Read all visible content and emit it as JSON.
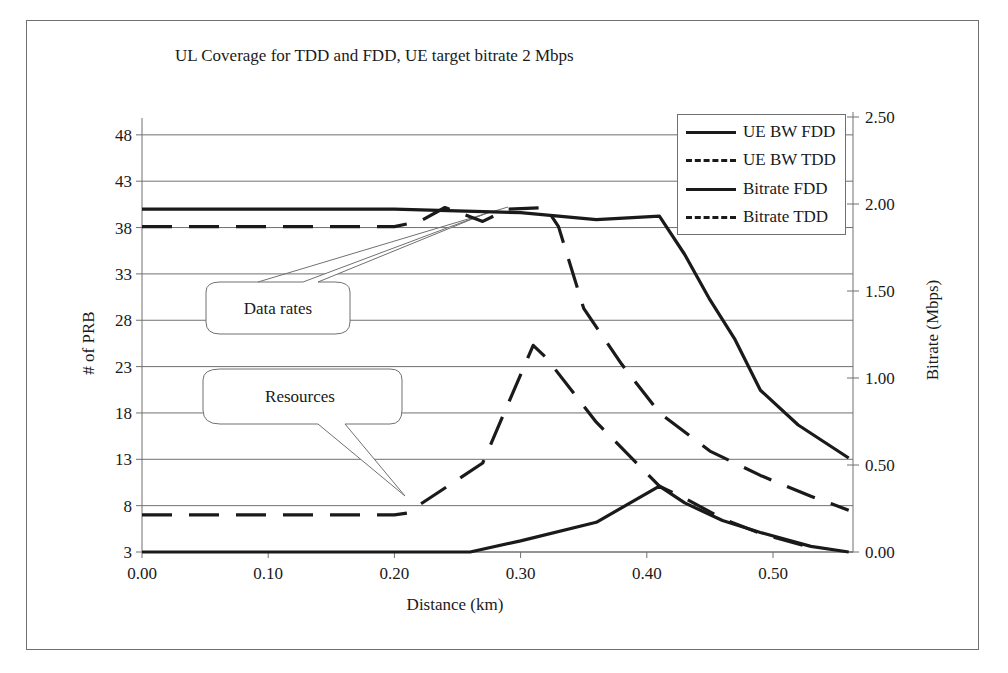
{
  "chart_data": {
    "type": "line",
    "title": "UL Coverage for TDD and FDD, UE target bitrate 2 Mbps",
    "xlabel": "Distance (km)",
    "ylabel": "# of PRB",
    "y2label": "Bitrate (Mbps)",
    "xlim": [
      0.0,
      0.57
    ],
    "ylim": [
      3,
      48
    ],
    "y2lim": [
      0.0,
      2.5
    ],
    "x_ticks": [
      "0.00",
      "0.10",
      "0.20",
      "0.30",
      "0.40",
      "0.50"
    ],
    "y_ticks": [
      "3",
      "8",
      "13",
      "18",
      "23",
      "28",
      "33",
      "38",
      "43",
      "48"
    ],
    "y2_ticks": [
      "0.00",
      "0.50",
      "1.00",
      "1.50",
      "2.00",
      "2.50"
    ],
    "grid": "horizontal",
    "legend_position": "upper right",
    "series": [
      {
        "name": "UE BW FDD",
        "axis": "left",
        "style": "solid",
        "x": [
          0.0,
          0.1,
          0.2,
          0.26,
          0.3,
          0.36,
          0.41,
          0.43,
          0.46,
          0.49,
          0.53,
          0.56
        ],
        "values": [
          3,
          3,
          3,
          3,
          4.2,
          6.2,
          10.1,
          8.3,
          6.4,
          5.1,
          3.6,
          3.0
        ]
      },
      {
        "name": "UE BW TDD",
        "axis": "left",
        "style": "dashed",
        "x": [
          0.0,
          0.1,
          0.2,
          0.21,
          0.27,
          0.31,
          0.32,
          0.36,
          0.41,
          0.43,
          0.46,
          0.49,
          0.53
        ],
        "values": [
          7,
          7,
          7,
          7.2,
          12.6,
          25.3,
          24.0,
          17.0,
          10.1,
          8.8,
          6.6,
          5.0,
          3.5
        ]
      },
      {
        "name": "Bitrate FDD",
        "axis": "right",
        "style": "solid",
        "x": [
          0.0,
          0.1,
          0.2,
          0.3,
          0.36,
          0.41,
          0.43,
          0.45,
          0.47,
          0.49,
          0.52,
          0.56
        ],
        "values": [
          1.97,
          1.97,
          1.97,
          1.95,
          1.91,
          1.93,
          1.71,
          1.45,
          1.22,
          0.93,
          0.73,
          0.54
        ]
      },
      {
        "name": "Bitrate TDD",
        "axis": "right",
        "style": "dashed",
        "x": [
          0.0,
          0.1,
          0.2,
          0.22,
          0.24,
          0.27,
          0.29,
          0.32,
          0.33,
          0.35,
          0.38,
          0.41,
          0.45,
          0.49,
          0.53,
          0.56
        ],
        "values": [
          1.87,
          1.87,
          1.87,
          1.9,
          1.98,
          1.9,
          1.97,
          1.98,
          1.87,
          1.4,
          1.08,
          0.8,
          0.58,
          0.44,
          0.32,
          0.24
        ]
      }
    ],
    "annotations": [
      {
        "text": "Data rates",
        "points_to": "Bitrate curves near 0.30 km"
      },
      {
        "text": "Resources",
        "points_to": "UE BW TDD near 0.21 km"
      }
    ]
  },
  "legend": {
    "items": [
      {
        "label": "UE BW FDD",
        "style": "solid"
      },
      {
        "label": "UE BW TDD",
        "style": "dashed"
      },
      {
        "label": "Bitrate FDD",
        "style": "solid"
      },
      {
        "label": "Bitrate TDD",
        "style": "dashed"
      }
    ]
  },
  "callouts": {
    "data_rates": "Data rates",
    "resources": "Resources"
  },
  "colors": {
    "line": "#1a1a1a",
    "grid": "#707070",
    "background": "#ffffff"
  }
}
